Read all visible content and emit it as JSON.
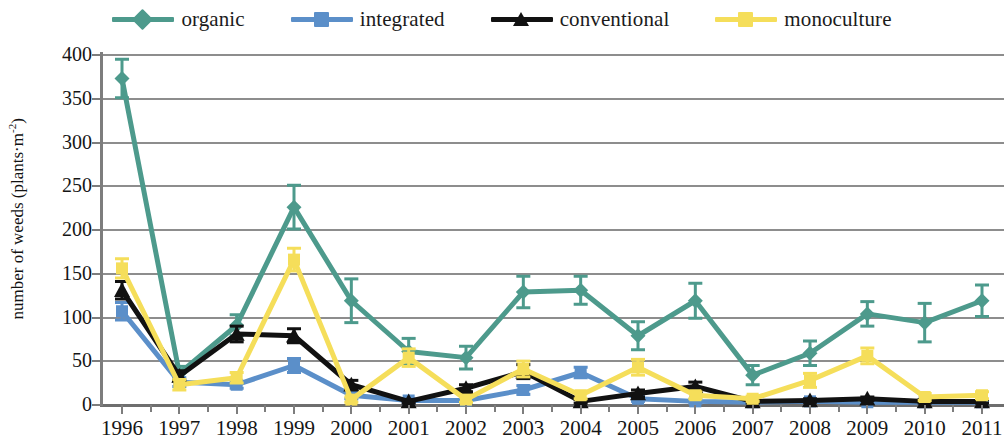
{
  "legend": {
    "position": "top-center",
    "items": [
      {
        "label": "organic",
        "color": "#4d9a8c",
        "marker": "diamond",
        "name": "organic"
      },
      {
        "label": "integrated",
        "color": "#5b8fc9",
        "marker": "square",
        "name": "integrated"
      },
      {
        "label": "conventional",
        "color": "#111111",
        "marker": "triangle",
        "name": "conventional"
      },
      {
        "label": "monoculture",
        "color": "#f5de5a",
        "marker": "square",
        "name": "monoculture"
      }
    ]
  },
  "axes": {
    "ylabel_main": "number of weeds (plants·m",
    "ylabel_sup": "-2",
    "ylabel_close": ")",
    "yticks": [
      "400",
      "350",
      "300",
      "250",
      "200",
      "150",
      "100",
      "50",
      "0"
    ],
    "xticks": [
      "1996",
      "1997",
      "1998",
      "1999",
      "2000",
      "2001",
      "2002",
      "2003",
      "2004",
      "2005",
      "2006",
      "2007",
      "2008",
      "2009",
      "2010",
      "2011"
    ]
  },
  "chart_data": {
    "type": "line",
    "title": "",
    "xlabel": "",
    "ylabel": "number of weeds (plants·m-2)",
    "ylim": [
      0,
      400
    ],
    "ytick_step": 50,
    "grid": true,
    "legend_position": "top-center",
    "error_bars": true,
    "x": [
      "1996",
      "1997",
      "1998",
      "1999",
      "2000",
      "2001",
      "2002",
      "2003",
      "2004",
      "2005",
      "2006",
      "2007",
      "2008",
      "2009",
      "2010",
      "2011"
    ],
    "categories": [
      "1996",
      "1997",
      "1998",
      "1999",
      "2000",
      "2001",
      "2002",
      "2003",
      "2004",
      "2005",
      "2006",
      "2007",
      "2008",
      "2009",
      "2010",
      "2011"
    ],
    "series": [
      {
        "name": "organic",
        "color": "#4d9a8c",
        "marker": "diamond",
        "values": [
          372,
          35,
          90,
          225,
          118,
          60,
          53,
          128,
          130,
          78,
          118,
          33,
          58,
          103,
          93,
          118
        ],
        "errors": [
          22,
          8,
          12,
          25,
          25,
          15,
          13,
          18,
          16,
          16,
          20,
          11,
          14,
          14,
          22,
          18
        ]
      },
      {
        "name": "integrated",
        "color": "#5b8fc9",
        "marker": "square",
        "values": [
          106,
          25,
          22,
          44,
          10,
          4,
          4,
          16,
          36,
          6,
          3,
          2,
          3,
          2,
          2,
          2
        ],
        "errors": [
          10,
          5,
          4,
          8,
          4,
          2,
          2,
          5,
          6,
          3,
          2,
          1,
          1,
          1,
          1,
          1
        ]
      },
      {
        "name": "conventional",
        "color": "#111111",
        "marker": "triangle",
        "values": [
          130,
          32,
          80,
          78,
          22,
          3,
          18,
          37,
          3,
          12,
          20,
          3,
          4,
          6,
          3,
          3
        ],
        "errors": [
          10,
          6,
          9,
          8,
          5,
          2,
          4,
          8,
          2,
          4,
          5,
          2,
          2,
          2,
          2,
          2
        ]
      },
      {
        "name": "monoculture",
        "color": "#f5de5a",
        "marker": "square",
        "values": [
          155,
          22,
          30,
          165,
          5,
          53,
          5,
          40,
          10,
          42,
          10,
          6,
          27,
          55,
          8,
          10
        ],
        "errors": [
          11,
          6,
          6,
          13,
          3,
          10,
          3,
          9,
          4,
          9,
          4,
          3,
          8,
          9,
          4,
          4
        ]
      }
    ]
  }
}
